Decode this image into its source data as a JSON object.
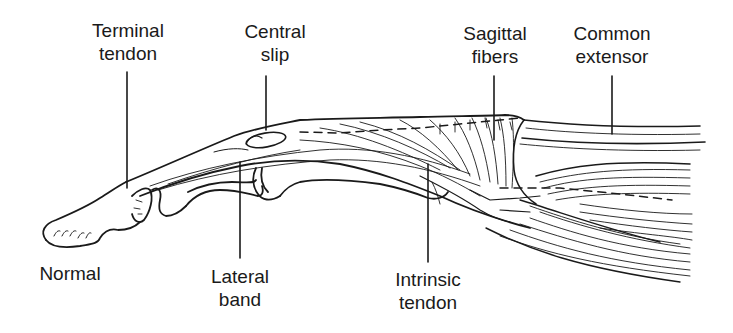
{
  "figure": {
    "type": "anatomical-illustration",
    "state_caption": "Normal",
    "colors": {
      "ink": "#1a1a1a",
      "background": "#ffffff"
    }
  },
  "labels": {
    "terminal_tendon": {
      "line1": "Terminal",
      "line2": "tendon"
    },
    "central_slip": {
      "line1": "Central",
      "line2": "slip"
    },
    "sagittal_fibers": {
      "line1": "Sagittal",
      "line2": "fibers"
    },
    "common_extensor": {
      "line1": "Common",
      "line2": "extensor"
    },
    "lateral_band": {
      "line1": "Lateral",
      "line2": "band"
    },
    "intrinsic_tendon": {
      "line1": "Intrinsic",
      "line2": "tendon"
    },
    "normal": {
      "line1": "Normal"
    }
  }
}
